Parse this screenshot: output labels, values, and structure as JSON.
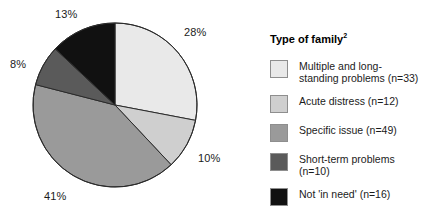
{
  "chart_data": {
    "type": "pie",
    "title": "Type of family",
    "title_superscript": "2",
    "xlabel": "",
    "ylabel": "",
    "legend_position": "right",
    "grid": false,
    "start_angle_deg": 0,
    "direction": "clockwise",
    "categories": [
      "Multiple and long-standing problems (n=33)",
      "Acute distress (n=12)",
      "Specific issue (n=49)",
      "Short-term problems (n=10)",
      "Not 'in need' (n=16)"
    ],
    "values": [
      28,
      10,
      41,
      8,
      13
    ],
    "counts": [
      33,
      12,
      49,
      10,
      16
    ],
    "value_labels": [
      "28%",
      "10%",
      "41%",
      "8%",
      "13%"
    ],
    "colors": [
      "#e9e9e9",
      "#cfcfcf",
      "#9a9a9a",
      "#5a5a5a",
      "#111111"
    ]
  },
  "legend": {
    "title": "Type of family",
    "title_superscript": "2",
    "items": [
      {
        "label": "Multiple and long-standing problems (n=33)",
        "color": "#e9e9e9"
      },
      {
        "label": "Acute distress (n=12)",
        "color": "#cfcfcf"
      },
      {
        "label": "Specific issue (n=49)",
        "color": "#9a9a9a"
      },
      {
        "label": "Short-term problems (n=10)",
        "color": "#5a5a5a"
      },
      {
        "label": "Not 'in need' (n=16)",
        "color": "#111111"
      }
    ]
  },
  "pie_geometry": {
    "center_x": 115,
    "center_y": 105,
    "radius": 82,
    "stroke": "#2b2b2b",
    "stroke_width": 1
  }
}
